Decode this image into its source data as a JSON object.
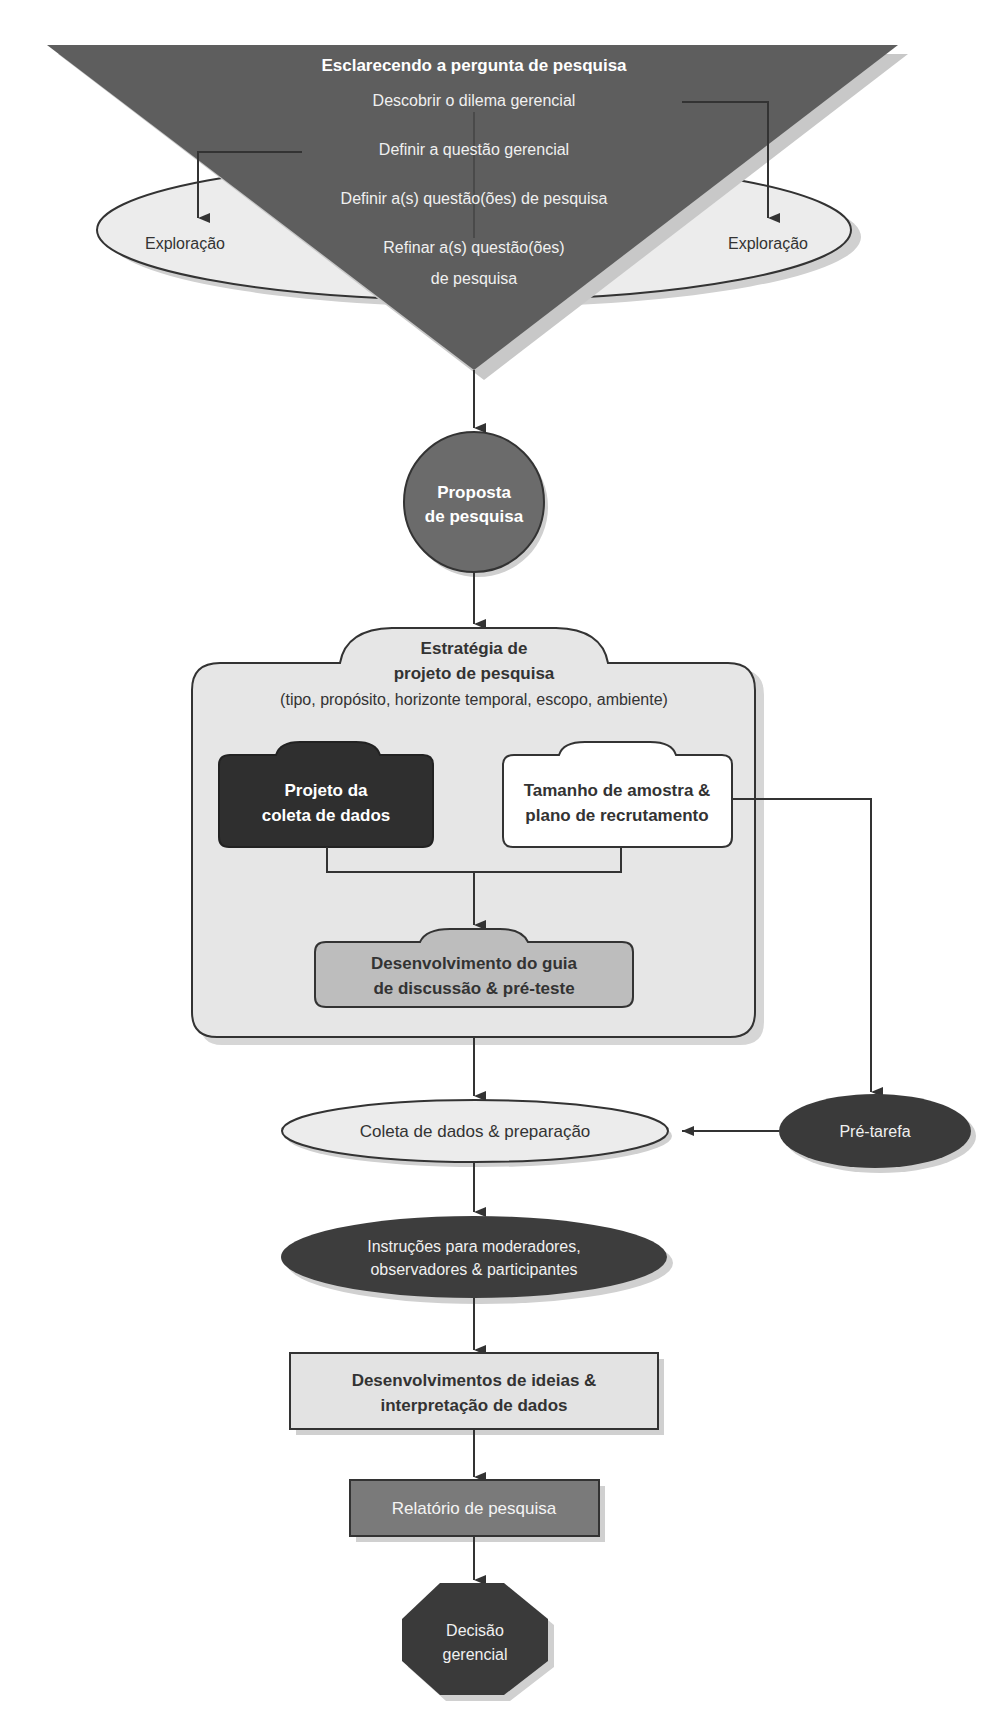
{
  "colors": {
    "triangle": "#5e5e5e",
    "ellipse_light": "#ececec",
    "circle": "#6b6b6b",
    "strategy_box": "#e6e6e6",
    "data_collection_box": "#2f2f2f",
    "sample_box": "#ffffff",
    "guide_box": "#bdbdbd",
    "collection_ellipse": "#ececec",
    "pretask_ellipse": "#3a3a3a",
    "instructions_ellipse": "#3d3d3d",
    "ideas_box": "#e3e3e3",
    "report_box": "#7a7a7a",
    "decision_octagon": "#3a3a3a",
    "stroke": "#333333"
  },
  "clarify": {
    "title": "Esclarecendo a pergunta de pesquisa",
    "steps": [
      "Descobrir o dilema gerencial",
      "Definir a questão gerencial",
      "Definir a(s) questão(ões) de pesquisa",
      "Refinar a(s) questão(ões)",
      "de pesquisa"
    ],
    "exploration_left": "Exploração",
    "exploration_right": "Exploração"
  },
  "proposal": {
    "line1": "Proposta",
    "line2": "de pesquisa"
  },
  "strategy": {
    "line1": "Estratégia de",
    "line2": "projeto de pesquisa",
    "line3": "(tipo, propósito, horizonte temporal, escopo, ambiente)",
    "data_collection": {
      "line1": "Projeto da",
      "line2": "coleta de dados"
    },
    "sample": {
      "line1": "Tamanho de amostra &",
      "line2": "plano de recrutamento"
    },
    "guide": {
      "line1": "Desenvolvimento do guia",
      "line2": "de discussão & pré-teste"
    }
  },
  "collection": "Coleta de dados & preparação",
  "pretask": "Pré-tarefa",
  "instructions": {
    "line1": "Instruções para moderadores,",
    "line2": "observadores & participantes"
  },
  "ideas": {
    "line1": "Desenvolvimentos de ideias &",
    "line2": "interpretação de dados"
  },
  "report": "Relatório de pesquisa",
  "decision": {
    "line1": "Decisão",
    "line2": "gerencial"
  }
}
